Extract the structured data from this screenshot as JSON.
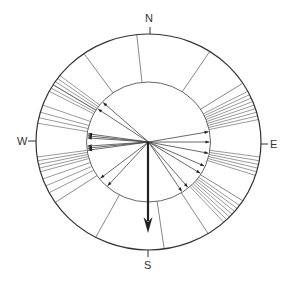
{
  "diagram": {
    "type": "circular orientation / vector rose diagram",
    "compass_labels": {
      "north": "N",
      "east": "E",
      "south": "S",
      "west": "W"
    },
    "colors": {
      "line": "#555555",
      "outer_ring": "#333333",
      "mean_vector": "#222222",
      "background": "#ffffff"
    },
    "geometry": {
      "center": [
        148.5,
        142
      ],
      "outer_radius": [
        112.5,
        108
      ],
      "inner_radius": [
        62,
        60
      ]
    },
    "sector_dividers_deg": [
      -6,
      33,
      57,
      123,
      148,
      172,
      208,
      236,
      302,
      325
    ],
    "inner_vectors_deg": [
      80,
      90,
      101,
      114,
      122,
      140,
      147,
      222,
      232,
      262,
      264,
      266,
      274,
      276,
      278,
      304,
      312
    ],
    "outer_bundles_deg": [
      [
        62,
        64,
        66,
        68,
        70,
        72,
        74,
        76,
        78
      ],
      [
        98,
        100,
        102,
        104,
        106,
        108
      ],
      [
        126,
        128,
        130,
        132,
        134,
        136,
        138
      ],
      [
        242,
        246,
        250,
        254,
        256,
        258,
        260,
        262
      ],
      [
        280,
        283,
        286,
        290
      ],
      [
        298,
        300,
        302,
        304,
        306,
        308
      ]
    ],
    "mean_vector": {
      "bearing_deg": 180,
      "length_px": 91
    }
  }
}
